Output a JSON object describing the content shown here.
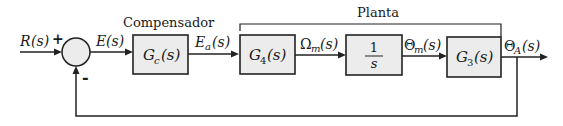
{
  "diagram": {
    "type": "block-diagram",
    "input": {
      "label": "R(s)",
      "main": "R",
      "arg": "(s)",
      "sign": "+"
    },
    "summing_junction": {
      "plus_sign": "+",
      "minus_sign": "-"
    },
    "error_signal": {
      "main": "E",
      "arg": "(s)"
    },
    "compensator": {
      "caption": "Compensador",
      "block": {
        "main": "G",
        "sub": "c",
        "arg": "(s)"
      }
    },
    "plant": {
      "caption": "Planta",
      "blocks": [
        {
          "id": "G4",
          "main": "G",
          "sub": "4",
          "arg": "(s)"
        },
        {
          "id": "integrator",
          "num": "1",
          "den": "s"
        },
        {
          "id": "G3",
          "main": "G",
          "sub": "3",
          "arg": "(s)"
        }
      ]
    },
    "signals": {
      "ea": {
        "main": "E",
        "sub": "a",
        "arg": "(s)"
      },
      "omega_m": {
        "main": "Ω",
        "sub": "m",
        "arg": "(s)"
      },
      "theta_m": {
        "main": "Θ",
        "sub": "m",
        "arg": "(s)"
      },
      "theta_a": {
        "main": "Θ",
        "sub": "A",
        "arg": "(s)"
      }
    },
    "colors": {
      "block_fill": "#ececec",
      "line": "#222222"
    }
  }
}
